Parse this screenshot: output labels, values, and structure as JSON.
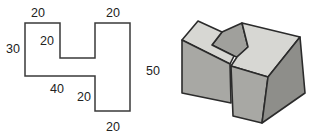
{
  "figure": {
    "orthographic_view": {
      "description": "dimensioned outline view",
      "outline_points": "25,23 60,23 60,58 95,58 95,23 130,23 130,111 95,111 95,76 25,76",
      "outline_stroke": "#3a3a3a",
      "fill": "#ffffff",
      "dimensions": [
        {
          "value": "20",
          "x": 38,
          "y": 17,
          "edge": "top-left-segment"
        },
        {
          "value": "20",
          "x": 113,
          "y": 17,
          "edge": "top-right-segment"
        },
        {
          "value": "30",
          "x": 13,
          "y": 53,
          "edge": "left-side"
        },
        {
          "value": "20",
          "x": 47,
          "y": 45,
          "edge": "notch-depth"
        },
        {
          "value": "50",
          "x": 153,
          "y": 75,
          "edge": "right-side"
        },
        {
          "value": "40",
          "x": 57,
          "y": 93,
          "edge": "bottom-left-segment"
        },
        {
          "value": "20",
          "x": 84,
          "y": 101,
          "edge": "step-height"
        },
        {
          "value": "20",
          "x": 113,
          "y": 131,
          "edge": "bottom-right-segment"
        }
      ]
    },
    "isometric_view": {
      "description": "pictorial view of the notched block",
      "outline_color": "#2b2b2b",
      "faces": [
        {
          "name": "slot-face",
          "fill": "#a0a09c",
          "points": "222,32 242,23 248,47 237,57 234,56 212,45"
        },
        {
          "name": "left-top-face",
          "fill": "#d7d7d3",
          "points": "198,21 222,32 212,45 234,56 230,64 182,40"
        },
        {
          "name": "right-top-face",
          "fill": "#d7d7d3",
          "points": "242,23 300,37 268,77 231,66 237,57 248,47"
        },
        {
          "name": "left-front-face",
          "fill": "#a8a8a4",
          "points": "182,40 230,64 231,103 182,93"
        },
        {
          "name": "right-front-face",
          "fill": "#a8a8a4",
          "points": "231,66 268,77 262,123 233,116"
        },
        {
          "name": "right-side-face",
          "fill": "#8e8e8a",
          "points": "300,37 305,93 262,123 268,77"
        }
      ]
    }
  }
}
